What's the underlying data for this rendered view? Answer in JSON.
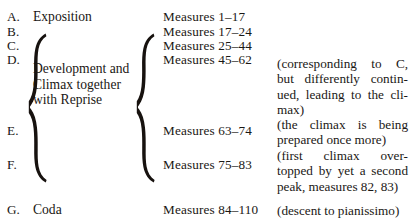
{
  "document": {
    "kind": "formal-structure-outline",
    "background_color": "#ffffff",
    "text_color": "#1a1714"
  },
  "rows": [
    {
      "letter": "A.",
      "section": "Exposition",
      "measures": "Measures 1–17"
    },
    {
      "letter": "B.",
      "section": "",
      "measures": "Measures 17–24"
    },
    {
      "letter": "C.",
      "section": "",
      "measures": "Measures 25–44"
    },
    {
      "letter": "D.",
      "section": "",
      "measures": "Measures 45–62"
    },
    {
      "letter": "E.",
      "section": "",
      "measures": "Measures 63–74"
    },
    {
      "letter": "F.",
      "section": "",
      "measures": "Measures 75–83"
    },
    {
      "letter": "G.",
      "section": "Coda",
      "measures": "Measures 84–110"
    }
  ],
  "group": {
    "label_lines": [
      "Development and",
      "Climax together",
      "with Reprise"
    ],
    "spans_letters": "B.–F."
  },
  "annotations": [
    {
      "for_letter": "D.",
      "lines": [
        "(corresponding to C,",
        "but differently contin-",
        "ued, leading to the cli-",
        "max)"
      ]
    },
    {
      "for_letter": "E.",
      "lines": [
        "(the climax is being",
        "prepared once more)"
      ]
    },
    {
      "for_letter": "F.",
      "lines": [
        "(first climax over-",
        "topped by yet a second",
        "peak, measures 82, 83)"
      ]
    },
    {
      "for_letter": "G.",
      "lines": [
        "(descent to pianissimo)"
      ]
    }
  ]
}
